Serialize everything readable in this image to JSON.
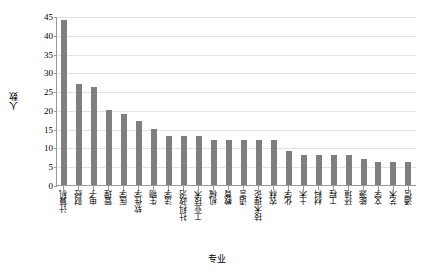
{
  "chart_data": {
    "type": "bar",
    "title": "",
    "xlabel": "专业",
    "ylabel": "人数",
    "ylim": [
      0,
      45
    ],
    "yticks": [
      0,
      5,
      10,
      15,
      20,
      25,
      30,
      35,
      40,
      45
    ],
    "grid": true,
    "legend": false,
    "bar_color": "#7f7f7f",
    "categories": [
      "计算机",
      "财经",
      "电子",
      "管理",
      "医学",
      "软件学",
      "生物",
      "法学",
      "社科政治",
      "工业技术",
      "机械",
      "教育",
      "语言",
      "技术理论",
      "农林",
      "化学",
      "土木",
      "材料",
      "工程",
      "环境",
      "能源",
      "文学",
      "艺术",
      "通信"
    ],
    "values": [
      44,
      27,
      26,
      20,
      19,
      17,
      15,
      13,
      13,
      13,
      12,
      12,
      12,
      12,
      12,
      9,
      8,
      8,
      8,
      8,
      7,
      6,
      6,
      6
    ]
  }
}
